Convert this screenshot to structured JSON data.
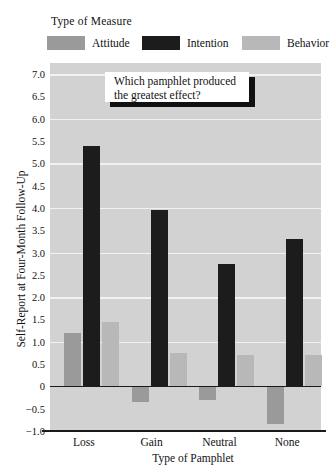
{
  "legend": {
    "title": "Type of Measure",
    "items": [
      {
        "label": "Attitude",
        "color": "#9a9a9a"
      },
      {
        "label": "Intention",
        "color": "#1c1c1c"
      },
      {
        "label": "Behavior",
        "color": "#b8b8b8"
      }
    ]
  },
  "callout": {
    "line1": "Which pamphlet produced",
    "line2": "the greatest effect?"
  },
  "chart_data": {
    "type": "bar",
    "title": "",
    "xlabel": "Type of Pamphlet",
    "ylabel": "Self-Report at Four-Month Follow-Up",
    "categories": [
      "Loss",
      "Gain",
      "Neutral",
      "None"
    ],
    "series": [
      {
        "name": "Attitude",
        "color": "#9a9a9a",
        "values": [
          1.2,
          -0.35,
          -0.3,
          -0.85
        ]
      },
      {
        "name": "Intention",
        "color": "#1c1c1c",
        "values": [
          5.4,
          3.95,
          2.75,
          3.3
        ]
      },
      {
        "name": "Behavior",
        "color": "#b8b8b8",
        "values": [
          1.45,
          0.75,
          0.7,
          0.7
        ]
      }
    ],
    "ylim": [
      -1.0,
      7.25
    ],
    "yticks": [
      7.0,
      6.5,
      6.0,
      5.5,
      5.0,
      4.5,
      4.0,
      3.5,
      3.0,
      2.5,
      2.0,
      1.5,
      1.0,
      0.5,
      0,
      -0.5,
      -1.0
    ],
    "ytick_labels": [
      "7.0",
      "6.5",
      "6.0",
      "5.5",
      "5.0",
      "4.5",
      "4.0",
      "3.5",
      "3.0",
      "2.5",
      "2.0",
      "1.5",
      "1.0",
      "0.5",
      "0",
      "−0.5",
      "−1.0"
    ],
    "gridlines": [
      7.0,
      6.0,
      5.0,
      4.0,
      3.0,
      2.0,
      1.0
    ],
    "grid": true,
    "legend_position": "top",
    "plot_background": "#d2d2d2"
  }
}
